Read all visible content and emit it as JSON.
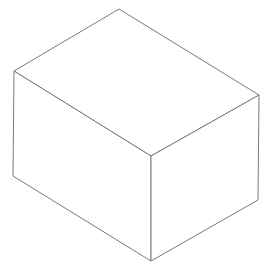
{
  "diagram": {
    "title": "",
    "shape": "isometric-box",
    "stroke_color": "#7a7a7a",
    "stroke_width": 1,
    "fill_color": "#ffffff",
    "background": "#ffffff",
    "vertices": {
      "top_back": [
        119,
        9
      ],
      "top_left": [
        14,
        71
      ],
      "top_right": [
        259,
        95
      ],
      "top_front": [
        151,
        156
      ],
      "bottom_left": [
        13,
        176
      ],
      "bottom_right": [
        258,
        200
      ],
      "bottom_front": [
        151,
        261
      ]
    },
    "faces": [
      {
        "name": "top-face",
        "points": "119,9 259,95 151,156 14,71"
      },
      {
        "name": "left-face",
        "points": "14,71 151,156 151,261 13,176"
      },
      {
        "name": "right-face",
        "points": "151,156 259,95 258,200 151,261"
      }
    ]
  }
}
